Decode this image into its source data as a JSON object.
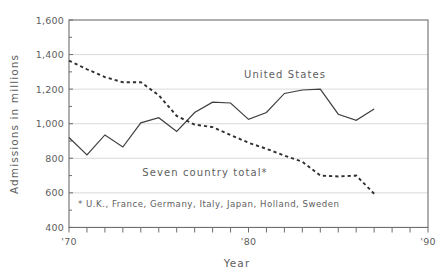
{
  "chart_data": {
    "type": "line",
    "title": "",
    "xlabel": "Year",
    "ylabel": "Admissions in millions",
    "xlim": [
      1970,
      1990
    ],
    "ylim": [
      400,
      1600
    ],
    "grid": true,
    "legend_position": "inline-annotation",
    "y_ticks": [
      400,
      600,
      800,
      1000,
      1200,
      1400,
      1600
    ],
    "y_tick_labels": [
      "400",
      "600",
      "800",
      "1,000",
      "1,200",
      "1,400",
      "1,600"
    ],
    "x_ticks": [
      1970,
      1971,
      1972,
      1973,
      1974,
      1975,
      1976,
      1977,
      1978,
      1979,
      1980,
      1981,
      1982,
      1983,
      1984,
      1985,
      1986,
      1987,
      1988,
      1989,
      1990
    ],
    "x_tick_labels": [
      "'70",
      "",
      "",
      "",
      "",
      "",
      "",
      "",
      "",
      "",
      "'80",
      "",
      "",
      "",
      "",
      "",
      "",
      "",
      "",
      "",
      "'90"
    ],
    "x_labeled_ticks": [
      "'70",
      "'80",
      "'90"
    ],
    "x": [
      1970,
      1971,
      1972,
      1973,
      1974,
      1975,
      1976,
      1977,
      1978,
      1979,
      1980,
      1981,
      1982,
      1983,
      1984,
      1985,
      1986,
      1987
    ],
    "series": [
      {
        "name": "United States",
        "style": "solid",
        "color": "#3f3f3f",
        "values": [
          920,
          820,
          935,
          865,
          1005,
          1035,
          955,
          1065,
          1125,
          1120,
          1025,
          1065,
          1175,
          1195,
          1200,
          1055,
          1020,
          1085
        ]
      },
      {
        "name": "Seven country total*",
        "style": "dashed",
        "color": "#303030",
        "values": [
          1365,
          1315,
          1270,
          1240,
          1240,
          1165,
          1045,
          995,
          980,
          935,
          890,
          855,
          815,
          780,
          700,
          695,
          700,
          595
        ]
      }
    ],
    "annotations": [
      {
        "name": "united-states-label",
        "text": "United States"
      },
      {
        "name": "seven-country-total-label",
        "text": "Seven country total*"
      },
      {
        "name": "footnote",
        "text": "* U.K., France, Germany, Italy, Japan, Holland, Sweden"
      }
    ],
    "colors": {
      "grid": "#c8c8c8",
      "frame": "#6d6d6d",
      "text": "#5e5e5e",
      "background": "#ffffff"
    }
  },
  "labels": {
    "y_axis_title": "Admissions in millions",
    "x_axis_title": "Year",
    "y_1600": "1,600",
    "y_1400": "1,400",
    "y_1200": "1,200",
    "y_1000": "1,000",
    "y_800": "800",
    "y_600": "600",
    "y_400": "400",
    "x_70": "'70",
    "x_80": "'80",
    "x_90": "'90",
    "series_us": "United States",
    "series_seven": "Seven country total*",
    "footnote": "* U.K., France, Germany, Italy, Japan, Holland, Sweden"
  }
}
